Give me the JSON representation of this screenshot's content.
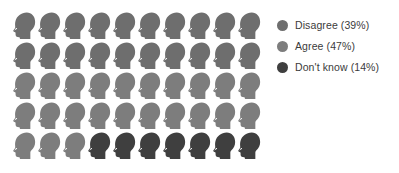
{
  "chart_data": {
    "type": "pictogram",
    "title": "",
    "xlabel": "",
    "ylabel": "",
    "icon": "head-silhouette-icon",
    "total_icons": 50,
    "columns": 10,
    "rows": 5,
    "icon_unit_percent": 2,
    "categories": [
      "Disagree",
      "Agree",
      "Don't know"
    ],
    "values": [
      39,
      47,
      14
    ],
    "value_suffix": "%",
    "icon_counts": [
      20,
      23,
      7
    ],
    "colors": [
      "#6e6e6e",
      "#7d7d7d",
      "#3f3f3f"
    ],
    "legend_position": "right",
    "grid": false,
    "series": [
      {
        "name": "Disagree",
        "value": 39,
        "label": "Disagree (39%)",
        "color": "#6e6e6e",
        "icons": 20
      },
      {
        "name": "Agree",
        "value": 47,
        "label": "Agree (47%)",
        "color": "#7d7d7d",
        "icons": 23
      },
      {
        "name": "Don't know",
        "value": 14,
        "label": "Don't know (14%)",
        "color": "#3f3f3f",
        "icons": 7
      }
    ],
    "icon_sequence": [
      0,
      0,
      0,
      0,
      0,
      0,
      0,
      0,
      0,
      0,
      0,
      0,
      0,
      0,
      0,
      0,
      0,
      0,
      0,
      0,
      1,
      1,
      1,
      1,
      1,
      1,
      1,
      1,
      1,
      1,
      1,
      1,
      1,
      1,
      1,
      1,
      1,
      1,
      1,
      1,
      1,
      1,
      1,
      2,
      2,
      2,
      2,
      2,
      2,
      2
    ]
  },
  "legend": {
    "items": [
      {
        "label": "Disagree (39%)",
        "color": "#6e6e6e"
      },
      {
        "label": "Agree (47%)",
        "color": "#7d7d7d"
      },
      {
        "label": "Don't know (14%)",
        "color": "#3f3f3f"
      }
    ]
  },
  "theme": {
    "background": "#ffffff",
    "text_color": "#3b3b3b"
  }
}
